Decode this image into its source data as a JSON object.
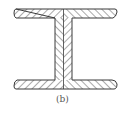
{
  "figure": {
    "label": "(b)",
    "stroke_color": "#3a3a3a",
    "hatch_color": "#555555",
    "background": "#ffffff"
  }
}
